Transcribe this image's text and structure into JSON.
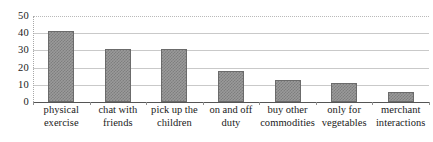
{
  "chart_data": {
    "type": "bar",
    "title": "",
    "subtitle": "",
    "xlabel": "",
    "ylabel": "",
    "categories": [
      "physical exercise",
      "chat with friends",
      "pick up the children",
      "on and off duty",
      "buy other commodities",
      "only for vegetables",
      "merchant interactions"
    ],
    "category_lines": [
      [
        "physical",
        "exercise"
      ],
      [
        "chat with",
        "friends"
      ],
      [
        "pick up the",
        "children"
      ],
      [
        "on and off",
        "duty"
      ],
      [
        "buy other",
        "commodities"
      ],
      [
        "only for",
        "vegetables"
      ],
      [
        "merchant",
        "interactions"
      ]
    ],
    "values": [
      41,
      31,
      31,
      18,
      13,
      11,
      6
    ],
    "ylim": [
      0,
      50
    ],
    "ytick_values": [
      0,
      10,
      20,
      30,
      40,
      50
    ],
    "ytick_labels": [
      "0",
      "10",
      "20",
      "30",
      "40",
      "50"
    ],
    "grid": true,
    "grid_axis": "y",
    "legend": false,
    "legend_position": "none",
    "series": [
      {
        "name": "",
        "values": [
          41,
          31,
          31,
          18,
          13,
          11,
          6
        ]
      }
    ],
    "colors": {
      "bar_fill": "#9a9a9a",
      "bar_hatch": "#7e7e7e",
      "bar_edge": "#6b6b6b",
      "gridline": "#c9c9c9",
      "axis_line": "#555555",
      "text": "#1a1a1a",
      "background": "#ffffff"
    }
  }
}
